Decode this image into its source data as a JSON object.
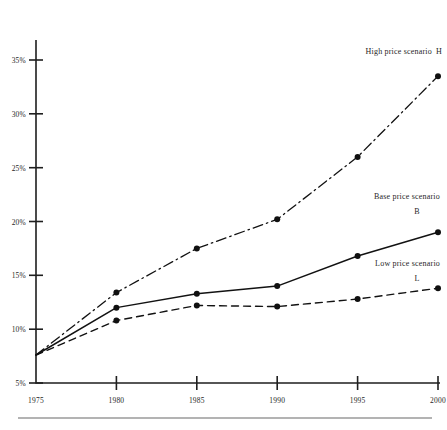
{
  "chart_data": {
    "type": "line",
    "title": "",
    "subtitle": "",
    "xlabel": "",
    "ylabel": "",
    "x": [
      1975,
      1980,
      1985,
      1990,
      1995,
      2000
    ],
    "xtick_labels": [
      "1975",
      "1980",
      "1985",
      "1990",
      "1995",
      "2000"
    ],
    "ytick_values": [
      5,
      10,
      15,
      20,
      25,
      30,
      35
    ],
    "ytick_labels": [
      "5%",
      "10%",
      "15%",
      "20%",
      "25%",
      "30%",
      "35%"
    ],
    "xlim": [
      1975,
      2000
    ],
    "ylim": [
      5,
      36.5
    ],
    "grid": false,
    "legend_position": "inline-right-of-series",
    "series": [
      {
        "name": "High price scenario",
        "key": "H",
        "style": "dash-dot",
        "marker": "filled-circle",
        "values": [
          7.6,
          13.4,
          17.5,
          20.2,
          26.0,
          33.5
        ]
      },
      {
        "name": "Base price scenario",
        "key": "B",
        "style": "solid",
        "marker": "filled-circle",
        "values": [
          7.6,
          12.0,
          13.3,
          14.0,
          16.8,
          19.0
        ]
      },
      {
        "name": "Low price scenario",
        "key": "L",
        "style": "dashed",
        "marker": "filled-circle",
        "values": [
          7.6,
          10.8,
          12.2,
          12.1,
          12.8,
          13.8
        ]
      }
    ],
    "annotations": [
      {
        "id": "high",
        "text": "High price scenario",
        "key": "H"
      },
      {
        "id": "base",
        "text": "Base price scenario",
        "key": "B"
      },
      {
        "id": "low",
        "text": "Low price scenario",
        "key": "L"
      }
    ],
    "colors": {
      "ink": "#1f1f1f",
      "marker": "#101010",
      "rule": "#9a9a9a",
      "background": "#ffffff"
    }
  }
}
